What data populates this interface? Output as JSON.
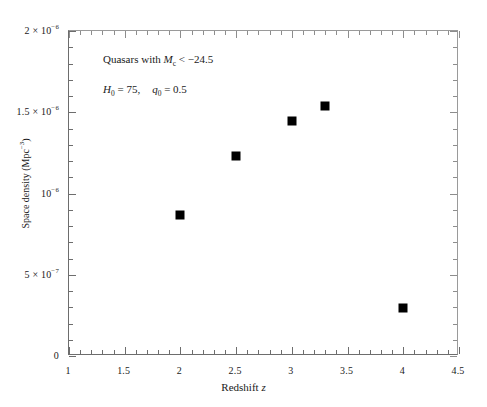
{
  "chart_data": {
    "type": "scatter",
    "title": "",
    "xlabel": "Redshift z",
    "ylabel": "Space density (Mpc⁻³)",
    "xlim": [
      1,
      4.5
    ],
    "ylim": [
      0,
      2e-06
    ],
    "grid": false,
    "legend": "none",
    "x": [
      2,
      2.5,
      3,
      3.3,
      4
    ],
    "values": [
      8.7e-07,
      1.23e-06,
      1.445e-06,
      1.538e-06,
      2.95e-07
    ],
    "series": [
      {
        "name": "Quasar space density",
        "marker": "filled-square",
        "color": "#000000",
        "points": [
          {
            "x": 2,
            "y": 8.7e-07
          },
          {
            "x": 2.5,
            "y": 1.23e-06
          },
          {
            "x": 3,
            "y": 1.445e-06
          },
          {
            "x": 3.3,
            "y": 1.538e-06
          },
          {
            "x": 4,
            "y": 2.95e-07
          }
        ]
      }
    ],
    "xticks": [
      {
        "value": 1,
        "label": "1"
      },
      {
        "value": 1.5,
        "label": "1.5"
      },
      {
        "value": 2,
        "label": "2"
      },
      {
        "value": 2.5,
        "label": "2.5"
      },
      {
        "value": 3,
        "label": "3"
      },
      {
        "value": 3.5,
        "label": "3.5"
      },
      {
        "value": 4,
        "label": "4"
      },
      {
        "value": 4.5,
        "label": "4.5"
      }
    ],
    "xtick_minor_step": 0.1,
    "yticks": [
      {
        "value": 0,
        "label": "0",
        "html": "0"
      },
      {
        "value": 5e-07,
        "label": "5 × 10⁻⁷",
        "html": "5 × 10<sup>−7</sup>"
      },
      {
        "value": 1e-06,
        "label": "10⁻⁶",
        "html": "10<sup>−6</sup>"
      },
      {
        "value": 1.5e-06,
        "label": "1.5 × 10⁻⁶",
        "html": "1.5 × 10<sup>−6</sup>"
      },
      {
        "value": 2e-06,
        "label": "2 × 10⁻⁶",
        "html": "2 × 10<sup>−6</sup>"
      }
    ],
    "ytick_minor_step": 1e-07,
    "annotations": [
      {
        "id": "annotation-0",
        "text": "Quasars with Mᴄ < −24.5",
        "html": "Quasars with <span class=\"ital\">M</span><sub>c</sub> < −24.5"
      },
      {
        "id": "annotation-1",
        "text": "H₀ = 75,   q₀ = 0.5",
        "html": "<span class=\"ital\">H</span><sub>0</sub> = 75,<span class=\"gap\"></span><span class=\"ital\">q</span><sub>0</sub> = 0.5"
      }
    ],
    "axis_title_x_html": "Redshift <span class=\"ital\">z</span>",
    "axis_title_y_html": "Space density (Mpc<sup>−3</sup>)",
    "marker_color": "#000000",
    "axis_color": "#6d6d6d",
    "background": "#ffffff"
  }
}
